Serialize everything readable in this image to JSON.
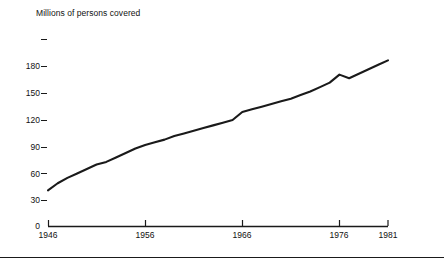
{
  "chart_data": {
    "type": "line",
    "title": "Millions of persons covered",
    "xlabel": "",
    "ylabel": "",
    "grid": false,
    "legend": "none",
    "xlim": [
      1946,
      1981
    ],
    "ylim": [
      0,
      210
    ],
    "y_ticks": [
      0,
      30,
      60,
      90,
      120,
      150,
      180,
      210
    ],
    "y_tick_labels": [
      "0",
      "30",
      "60",
      "90",
      "120",
      "150",
      "180",
      ""
    ],
    "x_ticks": [
      1946,
      1956,
      1966,
      1976,
      1981
    ],
    "x_tick_labels": [
      "1946",
      "1956",
      "1966",
      "1976",
      "1981"
    ],
    "x": [
      1946,
      1947,
      1948,
      1949,
      1950,
      1951,
      1952,
      1953,
      1954,
      1955,
      1956,
      1957,
      1958,
      1959,
      1960,
      1961,
      1962,
      1963,
      1964,
      1965,
      1966,
      1967,
      1968,
      1969,
      1970,
      1971,
      1972,
      1973,
      1974,
      1975,
      1976,
      1977,
      1978,
      1979,
      1980,
      1981
    ],
    "values": [
      40,
      48,
      54,
      59,
      64,
      69,
      72,
      77,
      82,
      87,
      91,
      94,
      97,
      101,
      104,
      107,
      110,
      113,
      116,
      119,
      128,
      131,
      134,
      137,
      140,
      143,
      147,
      151,
      156,
      161,
      170,
      166,
      171,
      176,
      181,
      186
    ],
    "series": [
      {
        "name": "Persons covered",
        "values": [
          40,
          48,
          54,
          59,
          64,
          69,
          72,
          77,
          82,
          87,
          91,
          94,
          97,
          101,
          104,
          107,
          110,
          113,
          116,
          119,
          128,
          131,
          134,
          137,
          140,
          143,
          147,
          151,
          156,
          161,
          170,
          166,
          171,
          176,
          181,
          186
        ],
        "color": "#1a1a1a"
      }
    ]
  },
  "figure": {
    "bottom_rule": true,
    "background": "#ffffff",
    "line_color": "#1a1a1a",
    "axis_color": "#1a1a1a"
  }
}
